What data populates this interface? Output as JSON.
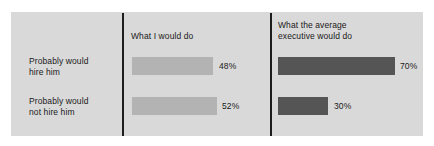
{
  "chart_data": {
    "type": "bar",
    "title": "",
    "xlabel": "",
    "ylabel": "",
    "orientation": "horizontal",
    "grid": false,
    "legend": "none",
    "xlim": [
      0,
      100
    ],
    "categories": [
      "Probably would\nhire him",
      "Probably would\nnot hire him"
    ],
    "series": [
      {
        "name": "What I would do",
        "values": [
          48,
          52
        ],
        "value_labels": [
          "48%",
          "52%"
        ],
        "color": "#b3b3b3"
      },
      {
        "name": "What the average\nexecutive would do",
        "values": [
          70,
          30
        ],
        "value_labels": [
          "70%",
          "30%"
        ],
        "color": "#555555"
      }
    ]
  },
  "panel": {
    "background": "#d9d9d9",
    "divider_color": "#1c1c1c"
  },
  "headers": {
    "mine": "What I would do",
    "exec": "What the average\nexecutive would do"
  },
  "rows": [
    {
      "label": "Probably would\nhire him"
    },
    {
      "label": "Probably would\nnot hire him"
    }
  ],
  "bars": {
    "mine": [
      {
        "label": "48%"
      },
      {
        "label": "52%"
      }
    ],
    "exec": [
      {
        "label": "70%"
      },
      {
        "label": "30%"
      }
    ]
  }
}
